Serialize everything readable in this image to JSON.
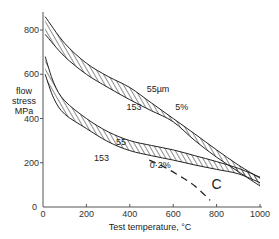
{
  "chart_data": {
    "type": "area",
    "title": "",
    "xlabel": "Test temperature, °C",
    "ylabel": "flow stress MPa",
    "ylabel_lines": [
      "flow",
      "stress",
      "MPa"
    ],
    "xlim": [
      0,
      1000
    ],
    "ylim": [
      0,
      880
    ],
    "x_ticks": [
      0,
      200,
      400,
      600,
      800,
      1000
    ],
    "y_ticks": [
      0,
      200,
      400,
      600,
      800
    ],
    "grid": false,
    "legend": null,
    "series": [
      {
        "name": "5% flow stress band",
        "style": "hatched-band",
        "x": [
          10,
          100,
          200,
          300,
          400,
          500,
          600,
          700,
          800,
          900,
          1000
        ],
        "upper": [
          860,
          740,
          650,
          590,
          540,
          470,
          400,
          330,
          258,
          190,
          130
        ],
        "lower": [
          780,
          680,
          600,
          540,
          485,
          435,
          385,
          300,
          225,
          160,
          95
        ]
      },
      {
        "name": "0.2% flow stress band",
        "style": "hatched-band",
        "x": [
          10,
          50,
          100,
          200,
          300,
          400,
          500,
          600,
          700,
          800,
          900,
          1000
        ],
        "upper": [
          680,
          560,
          480,
          400,
          340,
          300,
          278,
          258,
          232,
          205,
          175,
          135
        ],
        "lower": [
          600,
          490,
          420,
          355,
          295,
          255,
          232,
          212,
          190,
          170,
          150,
          110
        ]
      },
      {
        "name": "C",
        "style": "dashed",
        "x": [
          490,
          560,
          630,
          700,
          770
        ],
        "values": [
          212,
          180,
          140,
          95,
          30
        ]
      }
    ],
    "annotations": [
      {
        "text": "55µm",
        "x": 530,
        "y": 520,
        "refers_to": "upper edge of 5% band"
      },
      {
        "text": "153",
        "x": 420,
        "y": 440,
        "refers_to": "lower edge of 5% band"
      },
      {
        "text": "5%",
        "x": 640,
        "y": 440,
        "refers_to": "upper band"
      },
      {
        "text": "55",
        "x": 360,
        "y": 280,
        "refers_to": "upper edge of 0.2% band"
      },
      {
        "text": "153",
        "x": 270,
        "y": 210,
        "refers_to": "lower edge of 0.2% band"
      },
      {
        "text": "0·2%",
        "x": 540,
        "y": 175,
        "refers_to": "lower band"
      },
      {
        "text": "C",
        "x": 800,
        "y": 80,
        "refers_to": "dashed curve"
      }
    ]
  },
  "axes": {
    "x_title": "Test temperature, °C",
    "y_title": [
      "flow",
      "stress",
      "MPa"
    ],
    "x_tick_labels": [
      "0",
      "200",
      "400",
      "600",
      "800",
      "1000"
    ],
    "y_tick_labels": [
      "0",
      "200",
      "400",
      "600",
      "800"
    ]
  },
  "colors": {
    "ink": "#222222",
    "axis": "#555555",
    "background": "#ffffff"
  }
}
